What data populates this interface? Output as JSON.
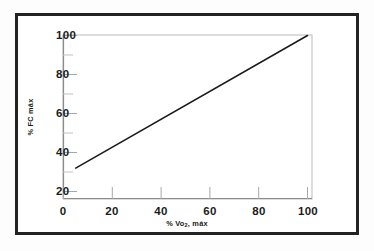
{
  "figure": {
    "background_color": "#ffffff",
    "frame_color": "#232323",
    "line_color": "#1b1b1b",
    "axis_color": "#9a9a9a"
  },
  "chart_data": {
    "type": "line",
    "title": "",
    "subtitle": "",
    "xlabel": "% Vo2 máx",
    "xlabel_main": "% Vo",
    "xlabel_sub": "2",
    "xlabel_tail": ", máx",
    "ylabel": "% FC máx",
    "xlim": [
      0,
      108
    ],
    "ylim": [
      10,
      104
    ],
    "xticks": [
      0,
      20,
      40,
      60,
      80,
      100
    ],
    "xtick_labels": [
      "0",
      "20",
      "40",
      "60",
      "80",
      "100"
    ],
    "yticks": [
      20,
      40,
      60,
      80,
      100
    ],
    "ytick_labels": [
      "20",
      "40",
      "60",
      "80",
      "100"
    ],
    "yminor_ticks": [
      30,
      50,
      70,
      90
    ],
    "grid": false,
    "legend": null,
    "series": [
      {
        "name": "relación % FC máx vs % Vo2 máx",
        "x": [
          5,
          100
        ],
        "y": [
          32,
          100
        ]
      }
    ],
    "annotations": []
  }
}
